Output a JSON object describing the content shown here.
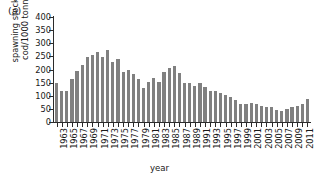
{
  "figure": {
    "panel_label": "(a)",
    "xlabel": "year",
    "ylabel": "spawning stock of\ncod/1000 tonnes"
  },
  "chart_data": {
    "type": "bar",
    "title": "(a)",
    "xlabel": "year",
    "ylabel": "spawning stock of cod/1000 tonnes",
    "ylim": [
      0,
      400
    ],
    "yticks": [
      0,
      50,
      100,
      150,
      200,
      250,
      300,
      350,
      400
    ],
    "grid": false,
    "legend": null,
    "bar_color": "#808080",
    "axis_color": "#2b2b2b",
    "xtick_labels_shown": [
      "1963",
      "1965",
      "1967",
      "1969",
      "1971",
      "1973",
      "1975",
      "1977",
      "1979",
      "1981",
      "1983",
      "1985",
      "1987",
      "1989",
      "1991",
      "1993",
      "1995",
      "1997",
      "1999",
      "2001",
      "2003",
      "2005",
      "2007",
      "2009",
      "2011"
    ],
    "categories": [
      1963,
      1964,
      1965,
      1966,
      1967,
      1968,
      1969,
      1970,
      1971,
      1972,
      1973,
      1974,
      1975,
      1976,
      1977,
      1978,
      1979,
      1980,
      1981,
      1982,
      1983,
      1984,
      1985,
      1986,
      1987,
      1988,
      1989,
      1990,
      1991,
      1992,
      1993,
      1994,
      1995,
      1996,
      1997,
      1998,
      1999,
      2000,
      2001,
      2002,
      2003,
      2004,
      2005,
      2006,
      2007,
      2008,
      2009,
      2010,
      2011,
      2012
    ],
    "values": [
      150,
      118,
      120,
      163,
      195,
      218,
      248,
      255,
      268,
      248,
      275,
      228,
      240,
      190,
      198,
      183,
      162,
      130,
      153,
      168,
      152,
      190,
      205,
      215,
      185,
      150,
      150,
      138,
      147,
      135,
      120,
      118,
      112,
      102,
      95,
      85,
      70,
      68,
      72,
      68,
      62,
      58,
      58,
      45,
      42,
      48,
      58,
      60,
      68,
      88
    ]
  }
}
